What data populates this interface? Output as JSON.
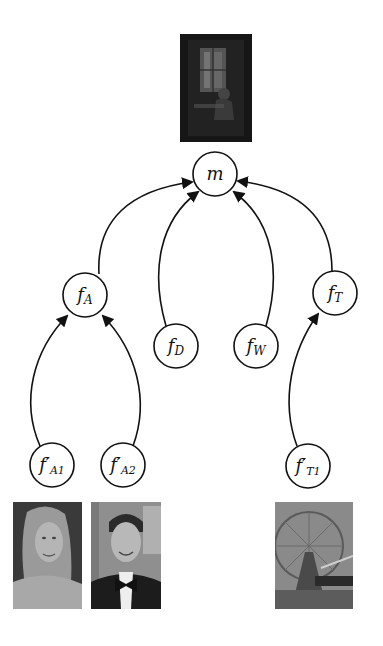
{
  "diagram": {
    "root": {
      "id": "m",
      "label": "m",
      "image": "movie-poster-dark-window"
    },
    "nodes": [
      {
        "id": "fA",
        "base": "f",
        "sub": "A",
        "prime": false
      },
      {
        "id": "fD",
        "base": "f",
        "sub": "D",
        "prime": false
      },
      {
        "id": "fW",
        "base": "f",
        "sub": "W",
        "prime": false
      },
      {
        "id": "fT",
        "base": "f",
        "sub": "T",
        "prime": false
      },
      {
        "id": "fA1p",
        "base": "f",
        "sub": "A1",
        "prime": true,
        "image": "actress-portrait"
      },
      {
        "id": "fA2p",
        "base": "f",
        "sub": "A2",
        "prime": true,
        "image": "actor-portrait-tuxedo"
      },
      {
        "id": "fT1p",
        "base": "f",
        "sub": "T1",
        "prime": true,
        "image": "ferris-wheel-scene"
      }
    ],
    "edges": [
      {
        "from": "fA",
        "to": "m"
      },
      {
        "from": "fD",
        "to": "m"
      },
      {
        "from": "fW",
        "to": "m"
      },
      {
        "from": "fT",
        "to": "m"
      },
      {
        "from": "fA1p",
        "to": "fA"
      },
      {
        "from": "fA2p",
        "to": "fA"
      },
      {
        "from": "fT1p",
        "to": "fT"
      }
    ]
  },
  "labels": {
    "m": "m",
    "fA_base": "f",
    "fA_sub": "A",
    "fD_base": "f",
    "fD_sub": "D",
    "fW_base": "f",
    "fW_sub": "W",
    "fT_base": "f",
    "fT_sub": "T",
    "fA1p_base": "f′",
    "fA1p_sub": "A1",
    "fA2p_base": "f′",
    "fA2p_sub": "A2",
    "fT1p_base": "f′",
    "fT1p_sub": "T1"
  }
}
